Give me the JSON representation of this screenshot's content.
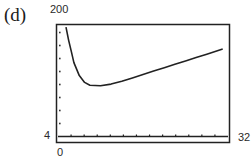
{
  "figure": {
    "part_label": "(d)",
    "ymax_label": "200",
    "ymin_label": "4",
    "xmin_label": "0",
    "xmax_label": "32"
  },
  "chart_data": {
    "type": "line",
    "title": "(d)",
    "xlabel": "",
    "ylabel": "",
    "xlim": [
      0,
      32
    ],
    "ylim": [
      4,
      200
    ],
    "grid": false,
    "legend": null,
    "tick_labels": {
      "x": [
        "0",
        "32"
      ],
      "y": [
        "4",
        "200"
      ]
    },
    "x_tick_count": 12,
    "y_tick_count": 8,
    "series": [
      {
        "name": "curve",
        "x": [
          1.5,
          2,
          2.5,
          3,
          4,
          5,
          6,
          8,
          10,
          12,
          14,
          16,
          18,
          20,
          22,
          24,
          26,
          28,
          30,
          31
        ],
        "y": [
          198,
          175,
          155,
          135,
          112,
          100,
          95,
          94,
          97,
          102,
          108,
          114,
          120,
          126,
          132,
          138,
          144,
          150,
          156,
          159
        ]
      }
    ],
    "colors": {
      "line": "#222222",
      "frame": "#222222",
      "background": "#ffffff"
    }
  }
}
